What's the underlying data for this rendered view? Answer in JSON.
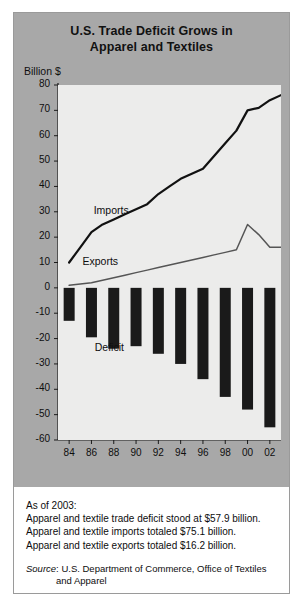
{
  "title": "U.S. Trade Deficit Grows in Apparel and Textiles",
  "title_line1": "U.S. Trade Deficit Grows in",
  "title_line2": "Apparel and Textiles",
  "y_axis_caption": "Billion $",
  "labels": {
    "imports": "Imports",
    "exports": "Exports",
    "deficit": "Deficit"
  },
  "notes": {
    "asof": "As of 2003:",
    "line1": "Apparel and textile trade deficit stood at $57.9 billion.",
    "line2": "Apparel and textile imports totaled $75.1 billion.",
    "line3": "Apparel and textile exports totaled $16.2 billion.",
    "source_word": "Source",
    "source_rest": ": U.S. Department of Commerce, Office of Textiles",
    "source_cont": "and Apparel"
  },
  "colors": {
    "panel": "#a8a8a8",
    "plot_background": "#ececeb",
    "bar": "#1a1a1a",
    "imports_line": "#111111",
    "exports_line": "#555555",
    "axis": "#1a1a1a",
    "text": "#0e0e0e"
  },
  "chart_data": {
    "type": "line",
    "title": "U.S. Trade Deficit Grows in Apparel and Textiles",
    "xlabel": "",
    "ylabel": "Billion $",
    "ylim": [
      -60,
      80
    ],
    "ytick_labels": [
      "80",
      "70",
      "60",
      "50",
      "40",
      "30",
      "20",
      "10",
      "0",
      "-10",
      "-20",
      "-30",
      "-40",
      "-50",
      "-60"
    ],
    "ytick_values": [
      80,
      70,
      60,
      50,
      40,
      30,
      20,
      10,
      0,
      -10,
      -20,
      -30,
      -40,
      -50,
      -60
    ],
    "xtick_labels": [
      "84",
      "86",
      "88",
      "90",
      "92",
      "94",
      "96",
      "98",
      "00",
      "02"
    ],
    "xtick_values": [
      1984,
      1986,
      1988,
      1990,
      1992,
      1994,
      1996,
      1998,
      2000,
      2002
    ],
    "xlim": [
      1983,
      2003
    ],
    "grid": false,
    "legend": "inline-annotations",
    "series": [
      {
        "name": "Imports",
        "type": "line",
        "x": [
          1984,
          1985,
          1986,
          1987,
          1988,
          1989,
          1990,
          1991,
          1992,
          1993,
          1994,
          1995,
          1996,
          1997,
          1998,
          1999,
          2000,
          2001,
          2002,
          2003
        ],
        "values": [
          10,
          16,
          22,
          25,
          27,
          29,
          31,
          33,
          37,
          40,
          43,
          45,
          47,
          52,
          57,
          62,
          70,
          71,
          74,
          76
        ]
      },
      {
        "name": "Exports",
        "type": "line",
        "x": [
          1984,
          1985,
          1986,
          1987,
          1988,
          1989,
          1990,
          1991,
          1992,
          1993,
          1994,
          1995,
          1996,
          1997,
          1998,
          1999,
          2000,
          2001,
          2002,
          2003
        ],
        "values": [
          1,
          1.5,
          2,
          3,
          4,
          5,
          6,
          7,
          8,
          9,
          10,
          11,
          12,
          13,
          14,
          15,
          25,
          21,
          16,
          16
        ]
      },
      {
        "name": "Deficit",
        "type": "bar",
        "x": [
          1984,
          1986,
          1988,
          1990,
          1992,
          1994,
          1996,
          1998,
          2000,
          2002
        ],
        "values": [
          -13,
          -19.5,
          -24,
          -23,
          -26,
          -30,
          -36,
          -43,
          -48,
          -55
        ]
      }
    ]
  }
}
